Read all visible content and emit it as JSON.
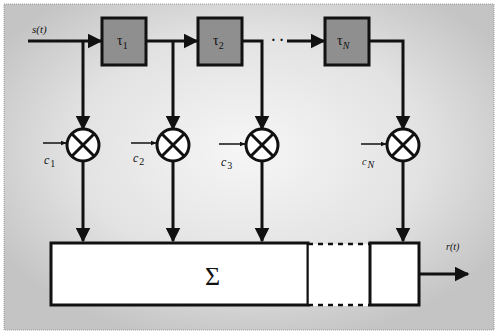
{
  "diagram": {
    "colors": {
      "frame_edge": "#bdbdbd",
      "frame_center": "#f4f4f4",
      "delay_fill": "#8f8f8f",
      "stroke": "#111111",
      "sum_fill": "#ffffff"
    },
    "input_label": "s(t)",
    "output_label": "r(t)",
    "ellipsis": "· ·",
    "delays": [
      {
        "symbol": "τ",
        "sub": "1"
      },
      {
        "symbol": "τ",
        "sub": "2"
      },
      {
        "symbol": "τ",
        "sub": "N"
      }
    ],
    "coefficients": [
      {
        "symbol": "c",
        "sub": "1"
      },
      {
        "symbol": "c",
        "sub": "2"
      },
      {
        "symbol": "c",
        "sub": "3"
      },
      {
        "symbol": "c",
        "sub": "N"
      }
    ],
    "multiplier_symbol": "⊗",
    "summer_symbol": "Σ"
  }
}
